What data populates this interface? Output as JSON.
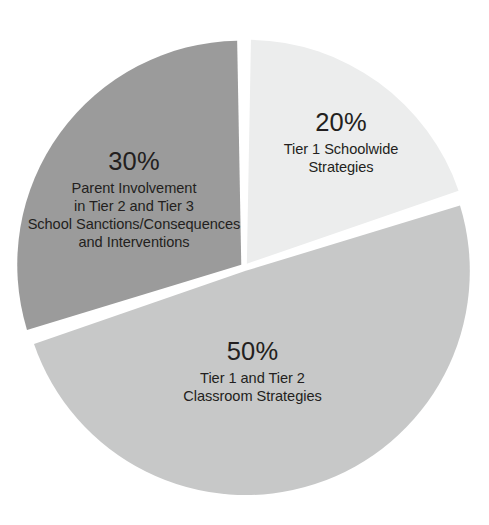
{
  "chart_data": {
    "type": "pie",
    "title": "",
    "subtitle": "",
    "xlabel": "",
    "ylabel": "",
    "legend_position": "none",
    "labels_position": "inside-slice",
    "grid": false,
    "start_angle_deg_from_12oclock": 0,
    "direction": "clockwise",
    "categories": [
      "Tier 1 Schoolwide Strategies",
      "Tier 1 and Tier 2 Classroom Strategies",
      "Parent Involvement in Tier 2 and Tier 3 School Sanctions/Consequences and Interventions"
    ],
    "values": [
      20,
      50,
      30
    ],
    "value_labels": [
      "20%",
      "50%",
      "30%"
    ],
    "colors": [
      "#eceded",
      "#c7c8c8",
      "#9b9b9b"
    ],
    "slices": [
      {
        "id": "tier1-schoolwide",
        "percent_label": "20%",
        "value": 20,
        "color": "#eceded",
        "start_deg": 0,
        "end_deg": 72,
        "description_lines": [
          "Tier 1 Schoolwide",
          "Strategies"
        ]
      },
      {
        "id": "tier1-tier2-classroom",
        "percent_label": "50%",
        "value": 50,
        "color": "#c7c8c8",
        "start_deg": 72,
        "end_deg": 252,
        "description_lines": [
          "Tier 1 and Tier 2",
          "Classroom Strategies"
        ]
      },
      {
        "id": "parent-involvement",
        "percent_label": "30%",
        "value": 30,
        "color": "#9b9b9b",
        "start_deg": 252,
        "end_deg": 360,
        "description_lines": [
          "Parent Involvement",
          "in Tier 2 and Tier 3",
          "School Sanctions/Consequences",
          "and Interventions"
        ]
      }
    ]
  },
  "canvas": {
    "background": "#ffffff",
    "text_color": "#231f20",
    "separator_color": "#ffffff"
  }
}
